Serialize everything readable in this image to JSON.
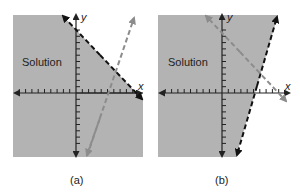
{
  "panels": [
    {
      "id": "a",
      "caption": "(a)",
      "region_label": "Solution",
      "x_axis_label": "x",
      "y_axis_label": "y",
      "boundary_line": "dashed black line with negative slope; shaded region below-left",
      "other_line": "dashed gray line with positive slope"
    },
    {
      "id": "b",
      "caption": "(b)",
      "region_label": "Solution",
      "x_axis_label": "x",
      "y_axis_label": "y",
      "boundary_line": "dashed black line with steep positive slope; shaded region to the left",
      "other_line": "dashed gray line with negative slope"
    }
  ],
  "colors": {
    "shade": "#b3b3b3",
    "boundary": "#111111",
    "secondary_line": "#8c8c8c",
    "axis": "#222222"
  }
}
